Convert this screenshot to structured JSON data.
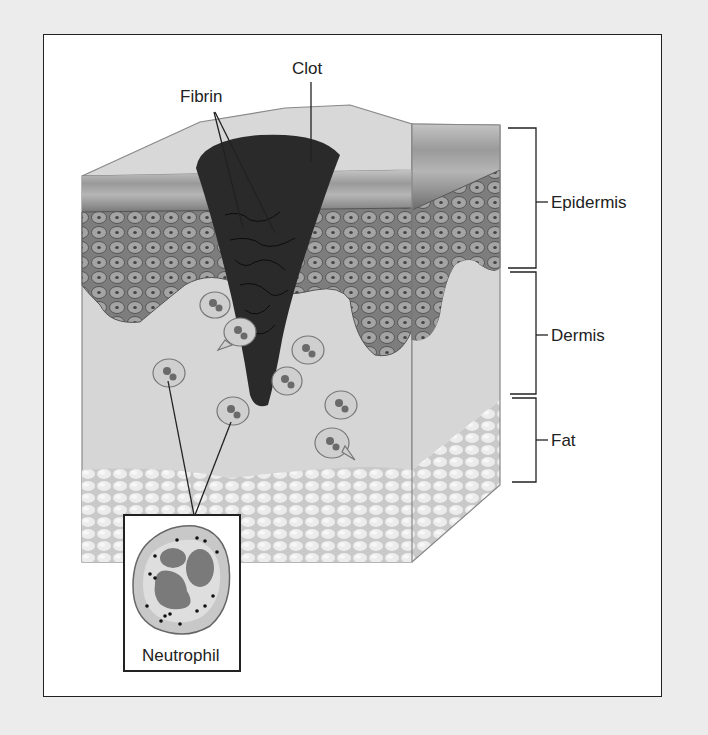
{
  "figure": {
    "type": "skin cross-section wound diagram",
    "labels": {
      "clot": "Clot",
      "fibrin": "Fibrin",
      "epidermis": "Epidermis",
      "dermis": "Dermis",
      "fat": "Fat",
      "neutrophil": "Neutrophil"
    },
    "layers": [
      {
        "name": "Epidermis",
        "bracket_top": 128,
        "bracket_bottom": 268
      },
      {
        "name": "Dermis",
        "bracket_top": 272,
        "bracket_bottom": 394
      },
      {
        "name": "Fat",
        "bracket_top": 398,
        "bracket_bottom": 482
      }
    ],
    "colors": {
      "background": "#ececec",
      "frame": "#ffffff",
      "epidermis_surface": "#a9a9a9",
      "cell_layer": "#8a8a8a",
      "dermis": "#d6d6d6",
      "fat": "#e2e2e2",
      "clot": "#2a2a2a",
      "line": "#222222"
    }
  }
}
